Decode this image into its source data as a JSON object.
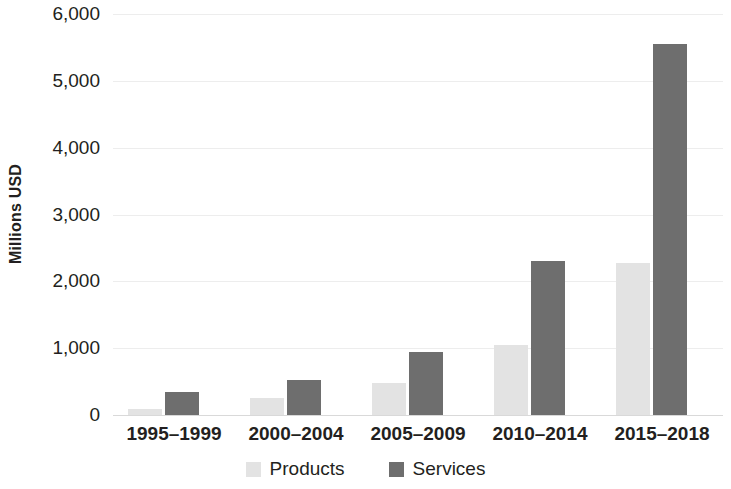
{
  "chart_data": {
    "type": "bar",
    "title": "",
    "subtitle": "",
    "xlabel": "",
    "ylabel": "Millions USD",
    "categories": [
      "1995–1999",
      "2000–2004",
      "2005–2009",
      "2010–2014",
      "2015–2018"
    ],
    "series": [
      {
        "name": "Products",
        "color": "#e3e3e3",
        "values": [
          90,
          250,
          480,
          1050,
          2280
        ]
      },
      {
        "name": "Services",
        "color": "#6e6e6e",
        "values": [
          345,
          525,
          945,
          2300,
          5550
        ]
      }
    ],
    "ylim": [
      0,
      6000
    ],
    "ytick_values": [
      0,
      1000,
      2000,
      3000,
      4000,
      5000,
      6000
    ],
    "ytick_labels": [
      "0",
      "1,000",
      "2,000",
      "3,000",
      "4,000",
      "5,000",
      "6,000"
    ],
    "grid": true,
    "grid_axis": "y",
    "legend_position": "bottom",
    "grouped": true,
    "background_color": "#ffffff",
    "gridline_color": "#ededed",
    "text_color": "#231f20"
  }
}
